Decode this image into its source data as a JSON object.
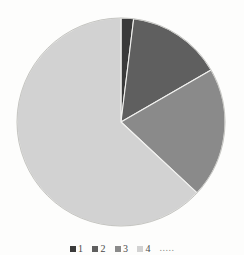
{
  "chart_data": {
    "type": "pie",
    "title": "",
    "subtitle": "",
    "xlabel": "",
    "ylabel": "",
    "grid": false,
    "legend_position": "bottom",
    "center": {
      "cx": 121,
      "cy": 122,
      "r": 104
    },
    "start_angle_deg": 0,
    "direction": "clockwise",
    "categories": [
      "1",
      "2",
      "3",
      "4"
    ],
    "values": [
      1.9,
      14.7,
      20.3,
      63.1
    ],
    "angles_deg": [
      7,
      53,
      73,
      227
    ],
    "colors": [
      "#3a3a3a",
      "#5f5f5f",
      "#8a8a8a",
      "#d2d2d2"
    ],
    "slices": [
      {
        "label": "1",
        "value": 1.9,
        "angle_deg": 7,
        "start_deg": 0,
        "end_deg": 7,
        "color": "#3a3a3a"
      },
      {
        "label": "2",
        "value": 14.7,
        "angle_deg": 53,
        "start_deg": 7,
        "end_deg": 60,
        "color": "#5f5f5f"
      },
      {
        "label": "3",
        "value": 20.3,
        "angle_deg": 73,
        "start_deg": 60,
        "end_deg": 133,
        "color": "#8a8a8a"
      },
      {
        "label": "4",
        "value": 63.1,
        "angle_deg": 227,
        "start_deg": 133,
        "end_deg": 360,
        "color": "#d2d2d2"
      }
    ],
    "annotations": []
  },
  "legend": {
    "items": [
      {
        "label": "1",
        "color": "#3a3a3a"
      },
      {
        "label": "2",
        "color": "#5f5f5f"
      },
      {
        "label": "3",
        "color": "#8a8a8a"
      },
      {
        "label": "4",
        "color": "#d2d2d2"
      }
    ],
    "trailing_text": "....."
  },
  "background": {
    "paper_color": "#fdfdfc",
    "outline_color": "#b9b9b5",
    "bleed_text_color": "#c9c9c4",
    "bleed_lines": [
      {
        "text": "sopra le ragioni",
        "x": 60,
        "y": 60
      },
      {
        "text": "con le condizioni indicate",
        "x": 34,
        "y": 73
      },
      {
        "text": "a quelle norme che",
        "x": 30,
        "y": 86
      },
      {
        "text": "sulla differenza di quel",
        "x": 28,
        "y": 99
      },
      {
        "text": "nella distribuzione de",
        "x": 30,
        "y": 112
      },
      {
        "text": "della stessa misura in",
        "x": 32,
        "y": 125
      },
      {
        "text": "delle rendite, dalla",
        "x": 38,
        "y": 138
      },
      {
        "text": "quali sono ripartiti",
        "x": 40,
        "y": 151
      },
      {
        "text": "per altra condizione",
        "x": 36,
        "y": 164
      },
      {
        "text": "che il valore delle",
        "x": 44,
        "y": 177
      },
      {
        "text": "ed in quella parte",
        "x": 48,
        "y": 190
      },
      {
        "text": "delle cose",
        "x": 72,
        "y": 203
      }
    ]
  }
}
